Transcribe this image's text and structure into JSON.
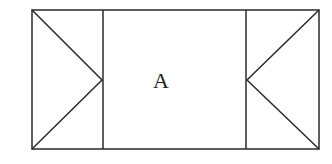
{
  "diagram": {
    "center_label": "A",
    "stroke_color": "#2a2a2a",
    "background": "#ffffff"
  }
}
